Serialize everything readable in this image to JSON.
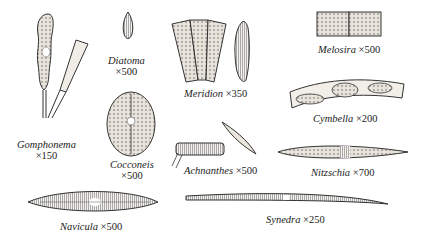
{
  "figure": {
    "specimens": [
      {
        "name": "Gomphonema",
        "magnification": "×150"
      },
      {
        "name": "Diatoma",
        "magnification": "×500"
      },
      {
        "name": "Meridion",
        "magnification": "×350"
      },
      {
        "name": "Melosira",
        "magnification": "×500"
      },
      {
        "name": "Cymbella",
        "magnification": "×200"
      },
      {
        "name": "Cocconeis",
        "magnification": "×500"
      },
      {
        "name": "Achnanthes",
        "magnification": "×500"
      },
      {
        "name": "Nitzschia",
        "magnification": "×700"
      },
      {
        "name": "Navicula",
        "magnification": "×500"
      },
      {
        "name": "Synedra",
        "magnification": "×250"
      }
    ]
  }
}
